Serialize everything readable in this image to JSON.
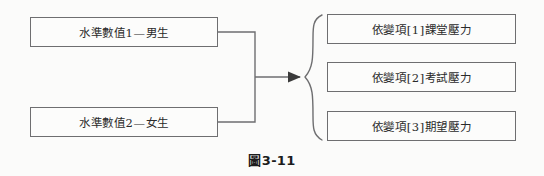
{
  "figure": {
    "caption_prefix": "圖",
    "caption_number": "3-11",
    "caption_full": "圖3-11"
  },
  "independent_levels": {
    "group_label": "independent-variable-levels",
    "items": [
      {
        "id": "level-1",
        "label": "水準數值1—男生"
      },
      {
        "id": "level-2",
        "label": "水準數值2—女生"
      }
    ]
  },
  "dependent_variables": {
    "group_label": "dependent-variables",
    "items": [
      {
        "id": "dv-1",
        "label": "依變項[1]課堂壓力"
      },
      {
        "id": "dv-2",
        "label": "依變項[2]考試壓力"
      },
      {
        "id": "dv-3",
        "label": "依變項[3]期望壓力"
      }
    ]
  },
  "connectors": {
    "left_bracket_name": "left-group-bracket",
    "arrow_name": "flow-arrow",
    "right_brace_name": "right-group-brace"
  },
  "colors": {
    "background": "#fbfbfa",
    "box_border": "#6e6e70",
    "box_fill": "#fcfcfb",
    "text": "#2a2a2a",
    "line": "#6e6e70",
    "caption_text": "#1c1c1c"
  }
}
